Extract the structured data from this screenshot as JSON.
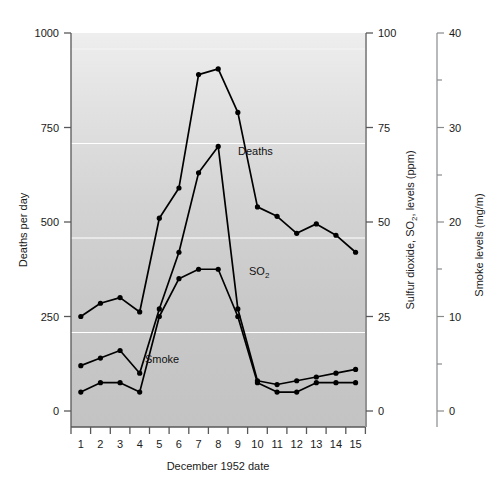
{
  "chart_data": {
    "type": "line",
    "title": "",
    "xlabel": "December 1952 date",
    "x": [
      1,
      2,
      3,
      4,
      5,
      6,
      7,
      8,
      9,
      10,
      11,
      12,
      13,
      14,
      15
    ],
    "xtick_labels": [
      "1",
      "2",
      "3",
      "4",
      "5",
      "6",
      "7",
      "8",
      "9",
      "10",
      "11",
      "12",
      "13",
      "14",
      "15"
    ],
    "grid": "horizontal white gridlines at 250, 500, 750 deaths",
    "legend_position": "inline labels on curves",
    "axes": [
      {
        "id": "deaths",
        "side": "left",
        "label": "Deaths per day",
        "ylim": [
          0,
          1000
        ],
        "ticks": [
          0,
          250,
          500,
          750,
          1000
        ],
        "tick_labels": [
          "0",
          "250",
          "500",
          "750",
          "1000"
        ]
      },
      {
        "id": "so2",
        "side": "right-inner",
        "label": "Sulfur dioxide, SO  levels (ppm)",
        "label_main": "Sulfur dioxide, SO",
        "label_sub": "2",
        "label_tail": ", levels (ppm)",
        "ylim": [
          0,
          100
        ],
        "ticks": [
          0,
          25,
          50,
          75,
          100
        ],
        "tick_labels": [
          "0",
          "25",
          "50",
          "75",
          "100"
        ]
      },
      {
        "id": "smoke",
        "side": "right-outer",
        "label": "Smoke levels (mg/m)",
        "ylim": [
          0,
          40
        ],
        "ticks": [
          0,
          10,
          20,
          30,
          40
        ],
        "tick_labels": [
          "0",
          "10",
          "20",
          "30",
          "40"
        ],
        "minor_ticks": [
          5,
          15,
          25,
          35
        ]
      }
    ],
    "series": [
      {
        "name": "Deaths",
        "axis": "deaths",
        "units": "deaths per day",
        "label_text": "Deaths",
        "values": [
          250,
          285,
          300,
          262,
          510,
          590,
          890,
          905,
          790,
          540,
          515,
          470,
          495,
          465,
          420
        ]
      },
      {
        "name": "SO2",
        "axis": "so2",
        "units": "ppm",
        "label_text": "SO",
        "label_sub": "2",
        "values": [
          12,
          14,
          16,
          10,
          27,
          42,
          63,
          70,
          27,
          8,
          7,
          8,
          9,
          10,
          11
        ]
      },
      {
        "name": "Smoke",
        "axis": "smoke",
        "units": "mg/m",
        "label_text": "Smoke",
        "values": [
          2,
          3,
          3,
          2,
          10,
          14,
          15,
          15,
          10,
          3,
          2,
          2,
          3,
          3,
          3
        ]
      }
    ]
  },
  "figure": {
    "plot_background": "#c9c9c9",
    "plot_background_top": "#ececec",
    "gridline_color": "#ffffff",
    "line_color": "#000000",
    "marker_color": "#000000",
    "axis_color": "#58585a"
  }
}
